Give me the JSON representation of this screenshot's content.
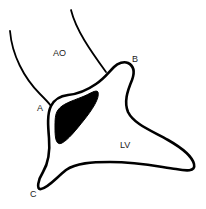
{
  "diagram": {
    "type": "anatomical line drawing",
    "labels": {
      "aorta": "AO",
      "point_a": "A",
      "point_b": "B",
      "point_c": "C",
      "left_ventricle": "LV"
    },
    "colors": {
      "stroke": "#000000",
      "fill_region": "#000000",
      "background": "#ffffff",
      "label_text": "#222222"
    }
  }
}
